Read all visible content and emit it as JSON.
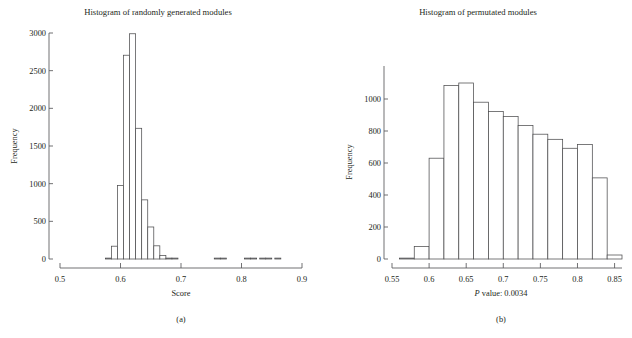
{
  "figure": {
    "panels": [
      {
        "id": "a",
        "caption": "(a)",
        "title": "Histogram of randomly generated modules",
        "xlabel": "Score",
        "ylabel": "Frequency"
      },
      {
        "id": "b",
        "caption": "(b)",
        "title": "Histogram of permutated modules",
        "xlabel_prefix": "P",
        "xlabel_rest": " value: 0.0034",
        "xlabel": "P value: 0.0034",
        "ylabel": "Frequency"
      }
    ]
  },
  "chart_data": [
    {
      "type": "bar",
      "title": "Histogram of randomly generated modules",
      "xlabel": "Score",
      "ylabel": "Frequency",
      "xlim": [
        0.5,
        0.9
      ],
      "ylim": [
        0,
        3000
      ],
      "xticks": [
        0.5,
        0.6,
        0.7,
        0.8,
        0.9
      ],
      "xticklabels": [
        "0.5",
        "0.6",
        "0.7",
        "0.8",
        "0.9"
      ],
      "yticks": [
        0,
        500,
        1000,
        1500,
        2000,
        2500,
        3000
      ],
      "yticklabels": [
        "0",
        "500",
        "1000",
        "1500",
        "2000",
        "2500",
        "3000"
      ],
      "grid": false,
      "legend": null,
      "bin_width": 0.01,
      "bin_starts": [
        0.575,
        0.585,
        0.595,
        0.605,
        0.615,
        0.625,
        0.635,
        0.645,
        0.655,
        0.665,
        0.675,
        0.685,
        0.755,
        0.765,
        0.805,
        0.815,
        0.83,
        0.84,
        0.855
      ],
      "values": [
        8,
        170,
        975,
        2705,
        2990,
        1735,
        785,
        425,
        175,
        45,
        12,
        6,
        4,
        4,
        5,
        5,
        7,
        6,
        4
      ]
    },
    {
      "type": "bar",
      "title": "Histogram of permutated modules",
      "xlabel": "P value: 0.0034",
      "ylabel": "Frequency",
      "xlim": [
        0.55,
        0.86
      ],
      "ylim": [
        0,
        1100
      ],
      "xticks": [
        0.55,
        0.6,
        0.65,
        0.7,
        0.75,
        0.8,
        0.85
      ],
      "xticklabels": [
        "0.55",
        "0.6",
        "0.65",
        "0.7",
        "0.75",
        "0.8",
        "0.85"
      ],
      "yticks": [
        0,
        200,
        400,
        600,
        800,
        1000
      ],
      "yticklabels": [
        "0",
        "200",
        "400",
        "600",
        "800",
        "1000"
      ],
      "grid": false,
      "legend": null,
      "bin_width": 0.02,
      "bin_starts": [
        0.56,
        0.58,
        0.6,
        0.62,
        0.64,
        0.66,
        0.68,
        0.7,
        0.72,
        0.74,
        0.76,
        0.78,
        0.8,
        0.82,
        0.84
      ],
      "values": [
        4,
        78,
        630,
        1085,
        1100,
        980,
        922,
        890,
        835,
        780,
        748,
        692,
        715,
        507,
        25
      ]
    }
  ]
}
